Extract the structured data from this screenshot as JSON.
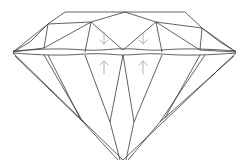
{
  "diagram": {
    "line_color": "#3a3a3a",
    "arrow_color": "#a8a8a8",
    "background": "#ffffff",
    "parts": [
      "crown",
      "girdle",
      "pavilion",
      "culet"
    ],
    "annotations": [
      {
        "type": "arrow",
        "direction": "down",
        "region": "crown",
        "position": "left-center"
      },
      {
        "type": "arrow",
        "direction": "down",
        "region": "crown",
        "position": "right-center"
      },
      {
        "type": "arrow",
        "direction": "up",
        "region": "pavilion",
        "position": "left-center"
      },
      {
        "type": "arrow",
        "direction": "up",
        "region": "pavilion",
        "position": "right-center"
      }
    ]
  }
}
